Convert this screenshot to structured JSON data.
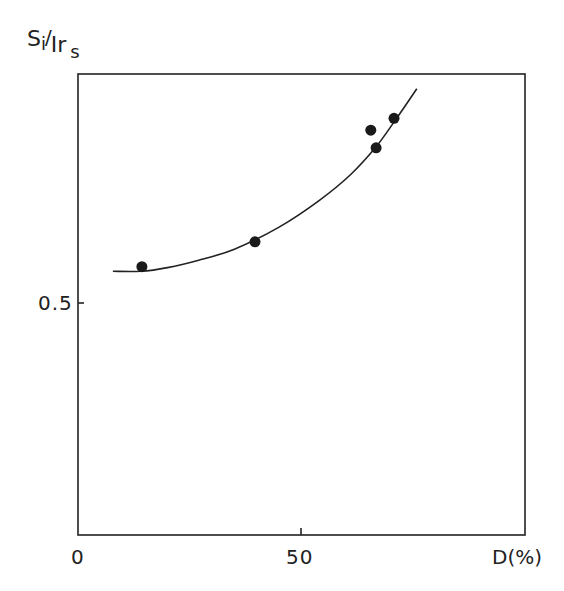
{
  "chart_data": {
    "type": "scatter",
    "title": "",
    "xlabel": "D(%)",
    "ylabel": "Si/Irs",
    "ylabel_parts": {
      "numerator": "S",
      "numerator_sub": "i",
      "denominator": "Ir",
      "denominator_sub": "s"
    },
    "xlim": [
      0,
      100
    ],
    "ylim": [
      0.25,
      0.75
    ],
    "x_ticks": [
      {
        "value": 0,
        "label": "0"
      },
      {
        "value": 50,
        "label": "50"
      }
    ],
    "y_ticks": [
      {
        "value": 0.5,
        "label": "0.5"
      }
    ],
    "grid": false,
    "legend": null,
    "series": [
      {
        "name": "measured",
        "kind": "points",
        "x": [
          14.3,
          39.6,
          65.5,
          66.7,
          70.7
        ],
        "y": [
          0.541,
          0.568,
          0.689,
          0.67,
          0.702
        ]
      },
      {
        "name": "fit curve",
        "kind": "line",
        "x": [
          7.8,
          14,
          20,
          27,
          35,
          45,
          54,
          61,
          66.5,
          71,
          75.8
        ],
        "y": [
          0.536,
          0.536,
          0.54,
          0.548,
          0.56,
          0.584,
          0.613,
          0.641,
          0.67,
          0.7,
          0.734
        ]
      }
    ]
  },
  "labels": {
    "y_num": "S",
    "y_num_sub": "i",
    "y_slash": "/",
    "y_den": "Ir",
    "y_den_sub": "s",
    "x_axis": "D(%)",
    "x_tick_0": "0",
    "x_tick_50": "50",
    "y_tick_05": "0.5"
  }
}
